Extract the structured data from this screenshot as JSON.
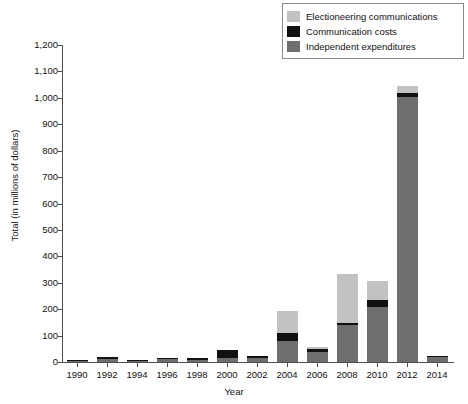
{
  "chart_data": {
    "type": "bar",
    "stacked": true,
    "title": "",
    "xlabel": "Year",
    "ylabel": "Total (in millions of dollars)",
    "categories": [
      "1990",
      "1992",
      "1994",
      "1996",
      "1998",
      "2000",
      "2002",
      "2004",
      "2006",
      "2008",
      "2010",
      "2012",
      "2014"
    ],
    "series": [
      {
        "name": "Independent expenditures",
        "color": "#6e6e6e",
        "values": [
          5,
          11,
          5,
          10,
          9,
          16,
          14,
          78,
          37,
          140,
          210,
          1003,
          18
        ]
      },
      {
        "name": "Communication costs",
        "color": "#111111",
        "values": [
          2,
          8,
          3,
          6,
          4,
          29,
          7,
          32,
          14,
          8,
          25,
          14,
          2
        ]
      },
      {
        "name": "Electioneering communications",
        "color": "#c2c2c2",
        "values": [
          0,
          0,
          0,
          0,
          0,
          0,
          0,
          85,
          4,
          187,
          70,
          28,
          0
        ]
      }
    ],
    "totals": [
      7,
      19,
      8,
      16,
      13,
      45,
      21,
      195,
      55,
      335,
      305,
      1045,
      20
    ],
    "ylim": [
      0,
      1200
    ],
    "yticks": [
      "0",
      "100",
      "200",
      "300",
      "400",
      "500",
      "600",
      "700",
      "800",
      "900",
      "1,000",
      "1,100",
      "1,200"
    ],
    "ytick_values": [
      0,
      100,
      200,
      300,
      400,
      500,
      600,
      700,
      800,
      900,
      1000,
      1100,
      1200
    ],
    "grid": false,
    "legend_position": "top-right",
    "legend": [
      {
        "label": "Electioneering communications",
        "color": "#c2c2c2"
      },
      {
        "label": "Communication costs",
        "color": "#111111"
      },
      {
        "label": "Independent expenditures",
        "color": "#6e6e6e"
      }
    ]
  }
}
